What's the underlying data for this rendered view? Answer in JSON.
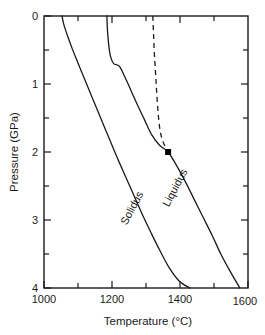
{
  "chart_data": {
    "type": "line",
    "title": "",
    "xlabel": "Temperature  (°C)",
    "ylabel": "Pressure (GPa)",
    "xlim": [
      1000,
      1600
    ],
    "ylim": [
      0,
      4
    ],
    "y_axis_inverted": true,
    "grid": false,
    "legend": "none",
    "x_major_ticks": [
      1000,
      1200,
      1400,
      1600
    ],
    "x_major_tick_labels": [
      "1000",
      "1200",
      "1400",
      "1600"
    ],
    "x_minor_ticks": [
      1100,
      1300,
      1500
    ],
    "y_major_ticks": [
      0,
      1,
      2,
      3,
      4
    ],
    "y_major_tick_labels": [
      "0",
      "1",
      "2",
      "3",
      "4"
    ],
    "y_minor_ticks": [
      0.5,
      1.5,
      2.5,
      3.5
    ],
    "annotations": [
      {
        "name": "invariant-point",
        "label": "",
        "x": 1365,
        "y": 2.0,
        "marker": "filled-square"
      }
    ],
    "series": [
      {
        "name": "Solidus",
        "label": "Solidus",
        "style": "solid",
        "label_rotation_deg": -62,
        "label_x": 1268,
        "label_y": 2.85,
        "points": [
          [
            1053,
            0.0
          ],
          [
            1057,
            0.1
          ],
          [
            1063,
            0.2
          ],
          [
            1072,
            0.33
          ],
          [
            1083,
            0.48
          ],
          [
            1095,
            0.63
          ],
          [
            1108,
            0.79
          ],
          [
            1122,
            0.96
          ],
          [
            1140,
            1.18
          ],
          [
            1160,
            1.42
          ],
          [
            1180,
            1.66
          ],
          [
            1200,
            1.9
          ],
          [
            1222,
            2.16
          ],
          [
            1245,
            2.42
          ],
          [
            1268,
            2.68
          ],
          [
            1292,
            2.95
          ],
          [
            1316,
            3.2
          ],
          [
            1342,
            3.46
          ],
          [
            1368,
            3.7
          ],
          [
            1398,
            3.9
          ],
          [
            1429,
            4.0
          ]
        ]
      },
      {
        "name": "Liquidus",
        "label": "Liquidus",
        "style": "solid",
        "label_rotation_deg": -62,
        "label_x": 1395,
        "label_y": 2.55,
        "points": [
          [
            1185,
            0.0
          ],
          [
            1186,
            0.15
          ],
          [
            1188,
            0.3
          ],
          [
            1191,
            0.45
          ],
          [
            1196,
            0.6
          ],
          [
            1205,
            0.7
          ],
          [
            1222,
            0.74
          ],
          [
            1240,
            0.92
          ],
          [
            1258,
            1.12
          ],
          [
            1276,
            1.32
          ],
          [
            1295,
            1.52
          ],
          [
            1316,
            1.74
          ],
          [
            1340,
            1.9
          ],
          [
            1365,
            2.0
          ],
          [
            1390,
            2.2
          ],
          [
            1416,
            2.44
          ],
          [
            1442,
            2.7
          ],
          [
            1468,
            2.96
          ],
          [
            1494,
            3.22
          ],
          [
            1520,
            3.5
          ],
          [
            1548,
            3.76
          ],
          [
            1576,
            4.0
          ]
        ]
      },
      {
        "name": "Dashed metastable extension",
        "label": "",
        "style": "dashed",
        "points": [
          [
            1320,
            0.0
          ],
          [
            1322,
            0.25
          ],
          [
            1324,
            0.5
          ],
          [
            1327,
            0.75
          ],
          [
            1330,
            1.0
          ],
          [
            1333,
            1.25
          ],
          [
            1337,
            1.5
          ],
          [
            1342,
            1.7
          ],
          [
            1350,
            1.85
          ],
          [
            1360,
            1.95
          ],
          [
            1365,
            2.0
          ]
        ]
      }
    ]
  }
}
